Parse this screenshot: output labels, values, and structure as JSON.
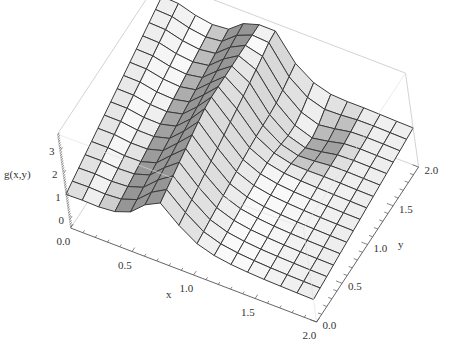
{
  "chart_data": {
    "type": "surface3d",
    "title": "",
    "xlabel": "x",
    "ylabel": "y",
    "zlabel": "g(x,y)",
    "xlim": [
      0.0,
      2.0
    ],
    "ylim": [
      0.0,
      2.0
    ],
    "zlim": [
      -0.35,
      3.75
    ],
    "x_ticks": [
      "0.0",
      "0.5",
      "1.0",
      "1.5",
      "2.0"
    ],
    "y_ticks": [
      "0.0",
      "0.5",
      "1.0",
      "1.5",
      "2.0"
    ],
    "z_ticks": [
      "0",
      "1",
      "2",
      "3"
    ],
    "mesh": {
      "nx": 15,
      "ny": 15
    },
    "sample_profile_y0": {
      "x": [
        0.0,
        0.25,
        0.5,
        0.75,
        1.0,
        1.25,
        1.5,
        1.75,
        2.0
      ],
      "z": [
        1.0,
        1.2,
        1.7,
        2.6,
        1.6,
        1.0,
        0.8,
        0.7,
        0.7
      ]
    },
    "sample_profile_y2": {
      "x": [
        0.0,
        0.25,
        0.5,
        0.75,
        1.0,
        1.25,
        1.5,
        1.75,
        2.0
      ],
      "z": [
        2.9,
        3.0,
        3.1,
        3.3,
        2.4,
        1.8,
        1.6,
        1.5,
        1.4
      ]
    },
    "grid": false,
    "box": true,
    "colors": {
      "surface_light": "#f4f4f4",
      "surface_dark": "#9a9a9a",
      "mesh": "#3a3a3a",
      "box": "#c8c8c8",
      "axis": "#555555"
    }
  }
}
